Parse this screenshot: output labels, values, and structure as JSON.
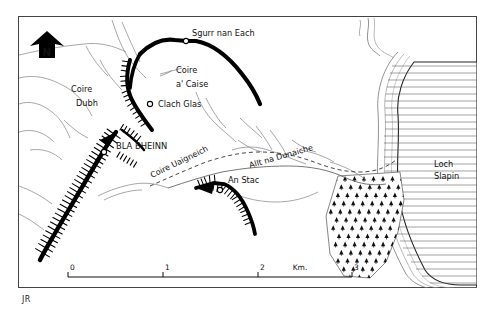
{
  "map": {
    "title_visible": false,
    "signature": "JR",
    "north_arrow": {
      "letter": "N",
      "name": "north-arrow"
    },
    "frame": {
      "x": 18,
      "y": 16,
      "w": 459,
      "h": 272,
      "stroke": "#444444"
    },
    "colors": {
      "ink": "#111111",
      "line": "#6b6b6b",
      "ridge": "#000000",
      "water_line": "#4a4a4a",
      "frame": "#444444",
      "paper": "#ffffff"
    },
    "labels": [
      {
        "id": "sgurr-nan-each",
        "text": "Sgurr nan Each",
        "x": 192,
        "y": 36,
        "size": 8.2,
        "rotate": 0,
        "anchor": "start"
      },
      {
        "id": "coire-a-caise-1",
        "text": "Coire",
        "x": 176,
        "y": 73,
        "size": 8.2,
        "rotate": 0,
        "anchor": "start"
      },
      {
        "id": "coire-a-caise-2",
        "text": "a' Caise",
        "x": 176,
        "y": 87,
        "size": 8.2,
        "rotate": 0,
        "anchor": "start"
      },
      {
        "id": "clach-glas",
        "text": "Clach Glas",
        "x": 158,
        "y": 107,
        "size": 8.2,
        "rotate": 0,
        "anchor": "start"
      },
      {
        "id": "coire-dubh-1",
        "text": "Coire",
        "x": 71,
        "y": 92,
        "size": 8.2,
        "rotate": 0,
        "anchor": "start"
      },
      {
        "id": "coire-dubh-2",
        "text": "Dubh",
        "x": 76,
        "y": 106,
        "size": 8.2,
        "rotate": 0,
        "anchor": "start"
      },
      {
        "id": "bla-bheinn",
        "text": "BLA BHEINN",
        "x": 116,
        "y": 149,
        "size": 8.4,
        "rotate": 0,
        "anchor": "start"
      },
      {
        "id": "coire-uaigneich",
        "text": "Coire Uaigneich",
        "x": 152,
        "y": 178,
        "size": 8.0,
        "rotate": -26,
        "anchor": "start"
      },
      {
        "id": "allt-na-dunaiche",
        "text": "Allt na Dunaiche",
        "x": 250,
        "y": 168,
        "size": 8.0,
        "rotate": -16,
        "anchor": "start"
      },
      {
        "id": "an-stac",
        "text": "An Stac",
        "x": 228,
        "y": 183,
        "size": 8.2,
        "rotate": 0,
        "anchor": "start"
      },
      {
        "id": "loch-slapin-1",
        "text": "Loch",
        "x": 434,
        "y": 167,
        "size": 8.2,
        "rotate": 0,
        "anchor": "start"
      },
      {
        "id": "loch-slapin-2",
        "text": "Slapin",
        "x": 434,
        "y": 179,
        "size": 8.2,
        "rotate": 0,
        "anchor": "start"
      }
    ],
    "summits": [
      {
        "id": "summit-sgurr-nan-each",
        "name": "Sgurr nan Each",
        "x": 186,
        "y": 41
      },
      {
        "id": "summit-clach-glas",
        "name": "Clach Glas",
        "x": 150,
        "y": 104
      },
      {
        "id": "summit-bla-bheinn",
        "name": "Bla Bheinn",
        "x": 104,
        "y": 152
      },
      {
        "id": "summit-an-stac",
        "name": "An Stac",
        "x": 220,
        "y": 190
      }
    ],
    "scale_bar": {
      "name": "scale-bar",
      "x_start": 68,
      "x_end": 352,
      "y": 277,
      "unit_label": "Km.",
      "unit_label_x": 300,
      "ticks": [
        {
          "label": "0",
          "x": 68
        },
        {
          "label": "1",
          "x": 163
        },
        {
          "label": "2",
          "x": 258
        },
        {
          "label": "3",
          "x": 352
        }
      ]
    },
    "features": {
      "loch": {
        "name": "Loch Slapin",
        "type": "water",
        "hatch": "horizontal-lines"
      },
      "forest": {
        "name": "conifer-plantation",
        "type": "forest",
        "symbol": "conifer"
      },
      "ridges": [
        {
          "name": "bla-bheinn-ridge",
          "type": "crag-ridge"
        },
        {
          "name": "clach-glas-ridge",
          "type": "crag-ridge"
        },
        {
          "name": "sgurr-nan-each-ridge",
          "type": "crag-ridge"
        },
        {
          "name": "an-stac-crag",
          "type": "crag-ridge"
        }
      ],
      "streams": {
        "name": "streams",
        "type": "watercourse"
      },
      "path": {
        "name": "footpath",
        "type": "dashed-track"
      }
    }
  }
}
